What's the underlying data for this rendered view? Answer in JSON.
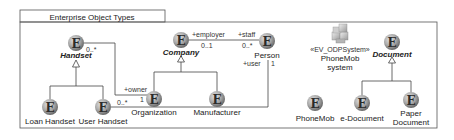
{
  "package": {
    "title": "Enterprise Object Types"
  },
  "colors": {
    "line": "#444444",
    "frame": "#555555",
    "entity_light": "#d8d8d8",
    "entity_dark": "#6e6e6e"
  },
  "entities": {
    "handset": {
      "label": "Handset",
      "abstract": true
    },
    "company": {
      "label": "Company",
      "abstract": true
    },
    "person": {
      "label": "Person"
    },
    "document": {
      "label": "Document",
      "abstract": true
    },
    "organization": {
      "label": "Organization"
    },
    "manufacturer": {
      "label": "Manufacturer"
    },
    "loan_handset": {
      "label": "Loan Handset"
    },
    "user_handset": {
      "label": "User Handset"
    },
    "phonemob": {
      "label": "PhoneMob"
    },
    "e_document": {
      "label": "e-Document"
    },
    "paper_document": {
      "label_line1": "Paper",
      "label_line2": "Document"
    }
  },
  "system": {
    "stereotype": "«EV_ODPSystem»",
    "name_line1": "PhoneMob",
    "name_line2": "system"
  },
  "associations": {
    "company_person": {
      "role_company": "+employer",
      "mult_company": "0..1",
      "role_person": "+staff",
      "mult_person": "0..*"
    },
    "handset_org": {
      "mult_handset": "0..*",
      "role_org": "+owner",
      "mult_org": "1"
    },
    "userhandset_person": {
      "mult_userhandset": "0..*",
      "role_person": "+user",
      "mult_person": "1"
    }
  },
  "entity_glyph": "E"
}
